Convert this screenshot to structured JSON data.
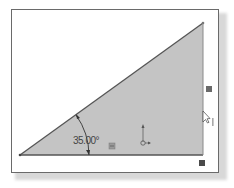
{
  "sketch": {
    "angle_dimension": "35.00°",
    "colors": {
      "fill": "#c4c4c4",
      "edge": "#555555",
      "frame": "#6a6a6a",
      "marker": "#5a5a5a"
    },
    "vertices": {
      "origin": [
        20,
        155
      ],
      "top": [
        203,
        23
      ],
      "right": [
        203,
        155
      ]
    }
  },
  "icons": {
    "relation_marker_bottom": "horizontal-relation-icon",
    "relation_marker_right": "vertical-relation-icon",
    "relation_marker_corner": "fixed-relation-icon",
    "origin_glyph": "sketch-origin-icon",
    "cursor": "mouse-pointer-icon"
  }
}
